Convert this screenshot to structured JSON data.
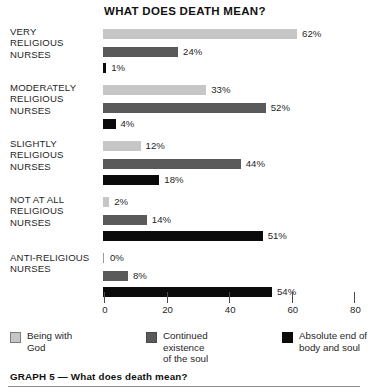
{
  "chart_data": {
    "type": "bar",
    "title": "WHAT DOES DEATH MEAN?",
    "orientation": "horizontal",
    "grouped": true,
    "xlabel": "",
    "ylabel": "",
    "xlim": [
      0,
      80
    ],
    "xticks": [
      0,
      20,
      40,
      60,
      80
    ],
    "xtick_labels": [
      "0",
      "20",
      "40",
      "60",
      "80"
    ],
    "grid": false,
    "legend_position": "bottom",
    "categories": [
      "VERY RELIGIOUS NURSES",
      "MODERATELY RELIGIOUS NURSES",
      "SLIGHTLY RELIGIOUS NURSES",
      "NOT AT ALL RELIGIOUS NURSES",
      "ANTI-RELIGIOUS NURSES"
    ],
    "series": [
      {
        "name": "Being with God",
        "color": "#c6c6c6",
        "values": [
          62,
          33,
          12,
          2,
          0
        ],
        "labels": [
          "62%",
          "33%",
          "12%",
          "2%",
          "0%"
        ]
      },
      {
        "name": "Continued existence of the soul",
        "color": "#5a5a5a",
        "values": [
          24,
          52,
          44,
          14,
          8
        ],
        "labels": [
          "24%",
          "52%",
          "44%",
          "14%",
          "8%"
        ]
      },
      {
        "name": "Absolute end of body and soul",
        "color": "#0b0b0b",
        "values": [
          1,
          4,
          18,
          51,
          54
        ],
        "labels": [
          "1%",
          "4%",
          "18%",
          "51%",
          "54%"
        ]
      }
    ]
  },
  "groups": [
    {
      "label_lines": [
        "VERY",
        "RELIGIOUS",
        "NURSES"
      ],
      "bars": [
        {
          "value": 62,
          "label": "62%",
          "series": "Being with God"
        },
        {
          "value": 24,
          "label": "24%",
          "series": "Continued existence of the soul"
        },
        {
          "value": 1,
          "label": "1%",
          "series": "Absolute end of body and soul"
        }
      ]
    },
    {
      "label_lines": [
        "MODERATELY",
        "RELIGIOUS",
        "NURSES"
      ],
      "bars": [
        {
          "value": 33,
          "label": "33%",
          "series": "Being with God"
        },
        {
          "value": 52,
          "label": "52%",
          "series": "Continued existence of the soul"
        },
        {
          "value": 4,
          "label": "4%",
          "series": "Absolute end of body and soul"
        }
      ]
    },
    {
      "label_lines": [
        "SLIGHTLY",
        "RELIGIOUS",
        "NURSES"
      ],
      "bars": [
        {
          "value": 12,
          "label": "12%",
          "series": "Being with God"
        },
        {
          "value": 44,
          "label": "44%",
          "series": "Continued existence of the soul"
        },
        {
          "value": 18,
          "label": "18%",
          "series": "Absolute end of body and soul"
        }
      ]
    },
    {
      "label_lines": [
        "NOT AT ALL",
        "RELIGIOUS",
        "NURSES"
      ],
      "bars": [
        {
          "value": 2,
          "label": "2%",
          "series": "Being with God"
        },
        {
          "value": 14,
          "label": "14%",
          "series": "Continued existence of the soul"
        },
        {
          "value": 51,
          "label": "51%",
          "series": "Absolute end of body and soul"
        }
      ]
    },
    {
      "label_lines": [
        "ANTI-RELIGIOUS",
        "NURSES"
      ],
      "bars": [
        {
          "value": 0,
          "label": "0%",
          "series": "Being with God"
        },
        {
          "value": 8,
          "label": "8%",
          "series": "Continued existence of the soul"
        },
        {
          "value": 54,
          "label": "54%",
          "series": "Absolute end of body and soul"
        }
      ]
    }
  ],
  "axis": {
    "ticks": [
      "0",
      "20",
      "40",
      "60",
      "80"
    ]
  },
  "legend": {
    "items": [
      {
        "color": "#c6c6c6",
        "lines": [
          "Being with",
          "God"
        ]
      },
      {
        "color": "#5a5a5a",
        "lines": [
          "Continued",
          "existence",
          "of the soul"
        ]
      },
      {
        "color": "#0b0b0b",
        "lines": [
          "Absolute end of",
          "body and soul"
        ]
      }
    ]
  },
  "caption": {
    "text": "GRAPH 5 — What does death mean?"
  }
}
